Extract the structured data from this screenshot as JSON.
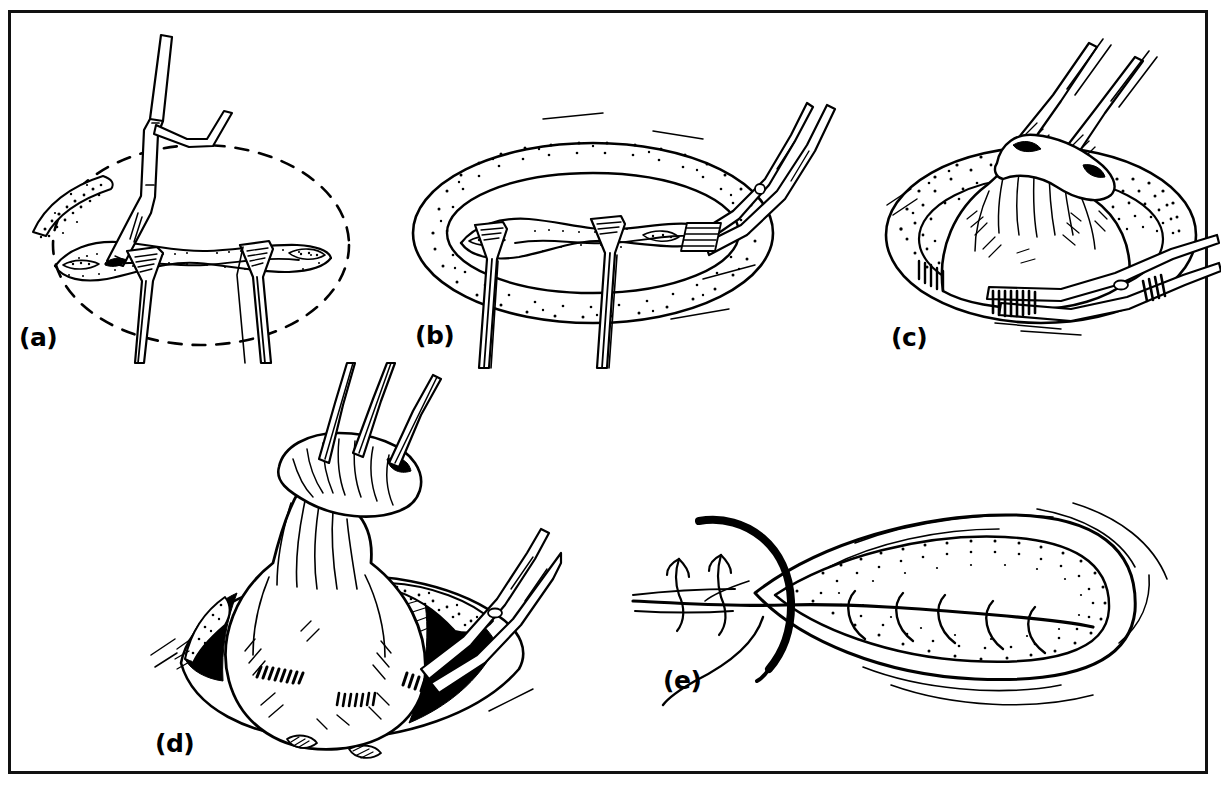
{
  "figure": {
    "style": "black ink line drawing on white, stippled shading",
    "frame": {
      "border_color": "#111111",
      "background_color": "#ffffff",
      "border_width_px": 3
    },
    "panels": [
      {
        "id": "a",
        "label": "(a)",
        "label_x": 16,
        "label_y": 322,
        "caption_semantic": "dashed oval marking of planned excision; toothed forceps elevates edge; two retractors hold incision open",
        "elements": [
          "dashed-ellipse-outline",
          "stippled-wound-edge",
          "toothed-forceps",
          "retractor-left",
          "retractor-right"
        ]
      },
      {
        "id": "b",
        "label": "(b)",
        "label_x": 411,
        "label_y": 322,
        "caption_semantic": "elliptical wound with stippled fat margin; scissors dissecting at right border; two retractors in place",
        "elements": [
          "stippled-ellipse-rim",
          "inner-wound-cavity",
          "retractor-left",
          "retractor-right",
          "dissecting-scissors"
        ]
      },
      {
        "id": "c",
        "label": "(c)",
        "label_x": 888,
        "label_y": 322,
        "caption_semantic": "lesion elevated by two tissue forceps; scissors dividing base within stippled cavity",
        "elements": [
          "stippled-cavity-rim",
          "elevated-mass",
          "tissue-forceps-pair",
          "curved-scissors"
        ]
      },
      {
        "id": "d",
        "label": "(d)",
        "label_x": 150,
        "label_y": 733,
        "caption_semantic": "mass fully mobilised and lifted on its pedicle by forceps; deep bed and vessels visible below",
        "elements": [
          "mobilised-mass",
          "pedicle-stalk",
          "forceps-trio",
          "deep-bed-shadow",
          "stippled-rim",
          "scissors-right"
        ]
      },
      {
        "id": "e",
        "label": "(e)",
        "label_x": 660,
        "label_y": 672,
        "caption_semantic": "closure of the elliptical defect with interrupted sutures using a curved needle",
        "elements": [
          "lens-shaped-wound",
          "stippled-bed",
          "curved-needle",
          "suture-thread",
          "interrupted-sutures"
        ]
      }
    ],
    "colors": {
      "ink": "#000000",
      "paper": "#ffffff",
      "frame": "#111111"
    }
  }
}
